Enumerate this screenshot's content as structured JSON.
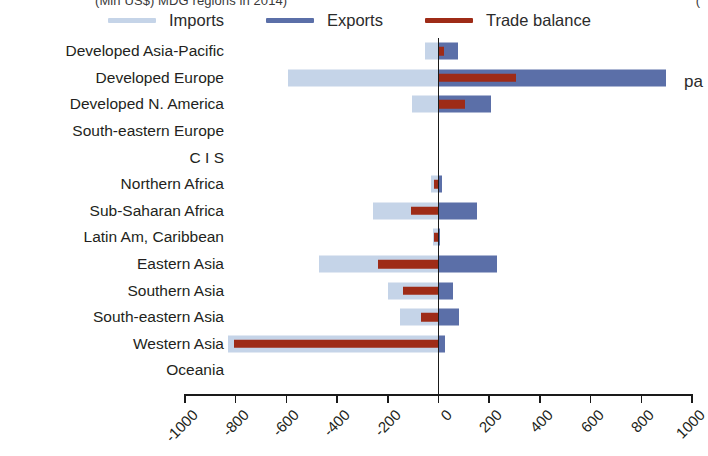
{
  "caption": {
    "text": "(Mln US$) MDG regions in 2014)",
    "right_fragment": "("
  },
  "side_text": "pa",
  "legend": {
    "items": [
      {
        "label": "Imports",
        "color": "#c5d4e8",
        "key": "imports"
      },
      {
        "label": "Exports",
        "color": "#5b6fa8",
        "key": "exports"
      },
      {
        "label": "Trade balance",
        "color": "#9e2b17",
        "key": "balance"
      }
    ]
  },
  "colors": {
    "imports": "#c5d4e8",
    "exports": "#5b6fa8",
    "balance": "#9e2b17",
    "axis": "#1a1a1a",
    "text": "#231f20"
  },
  "chart_data": {
    "type": "bar",
    "orientation": "horizontal",
    "title": "(Mln US$) MDG regions in 2014)",
    "xlabel": "",
    "ylabel": "",
    "xlim": [
      -1000,
      1000
    ],
    "xticks": [
      -1000,
      -800,
      -600,
      -400,
      -200,
      0,
      200,
      400,
      600,
      800,
      1000
    ],
    "xticklabels": [
      "-1000",
      "-800",
      "-600",
      "-400",
      "-200",
      "0",
      "200",
      "400",
      "600",
      "800",
      "1000"
    ],
    "grid": false,
    "legend_position": "top",
    "categories": [
      "Developed Asia-Pacific",
      "Developed Europe",
      "Developed N. America",
      "South-eastern Europe",
      "C I S",
      "Northern Africa",
      "Sub-Saharan Africa",
      "Latin Am, Caribbean",
      "Eastern Asia",
      "Southern Asia",
      "South-eastern Asia",
      "Western Asia",
      "Oceania"
    ],
    "series": [
      {
        "name": "Imports",
        "key": "imports",
        "note": "plotted as negative (leftward) values",
        "values": [
          -55,
          -592,
          -105,
          0,
          0,
          -28,
          -260,
          -22,
          -470,
          -200,
          -150,
          -830,
          0
        ]
      },
      {
        "name": "Exports",
        "key": "exports",
        "note": "plotted as positive (rightward) values",
        "values": [
          78,
          898,
          208,
          0,
          0,
          12,
          152,
          4,
          232,
          58,
          80,
          24,
          0
        ]
      },
      {
        "name": "Trade balance",
        "key": "balance",
        "note": "exports minus imports, drawn from 0 as a thin overlay bar",
        "values": [
          23,
          306,
          103,
          0,
          0,
          -16,
          -108,
          -18,
          -238,
          -142,
          -70,
          -806,
          0
        ]
      }
    ]
  }
}
